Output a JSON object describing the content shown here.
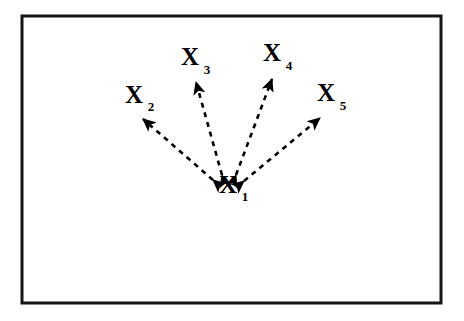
{
  "figure": {
    "background_color": "#ffffff",
    "frame": {
      "stroke_color": "#151515",
      "stroke_width": 3,
      "x": 22,
      "y": 16,
      "width": 419,
      "height": 287
    },
    "line_style": {
      "color": "#000000",
      "dash_pattern": "5 5",
      "stroke_width": 2.6,
      "arrowheads": "both-ends",
      "arrowhead_fill": "#000000"
    }
  },
  "nodes": [
    {
      "id": "x1",
      "symbol": "X",
      "subscript": "1",
      "label": "X1",
      "role": "center",
      "x": 228,
      "y": 193,
      "subscript_x": 245,
      "subscript_y": 201
    },
    {
      "id": "x2",
      "symbol": "X",
      "subscript": "2",
      "label": "X2",
      "role": "outer",
      "x": 134,
      "y": 103,
      "subscript_x": 151,
      "subscript_y": 111
    },
    {
      "id": "x3",
      "symbol": "X",
      "subscript": "3",
      "label": "X3",
      "role": "outer",
      "x": 190,
      "y": 65,
      "subscript_x": 207,
      "subscript_y": 74
    },
    {
      "id": "x4",
      "symbol": "X",
      "subscript": "4",
      "label": "X4",
      "role": "outer",
      "x": 272,
      "y": 61,
      "subscript_x": 289,
      "subscript_y": 70
    },
    {
      "id": "x5",
      "symbol": "X",
      "subscript": "5",
      "label": "X5",
      "role": "outer",
      "x": 326,
      "y": 101,
      "subscript_x": 343,
      "subscript_y": 110
    }
  ],
  "edges": [
    {
      "id": "edge-x1-x2",
      "from": "x1",
      "to": "x2",
      "direction": "bidirectional",
      "x1": 213,
      "y1": 180,
      "x2": 143,
      "y2": 119
    },
    {
      "id": "edge-x1-x3",
      "from": "x1",
      "to": "x3",
      "direction": "bidirectional",
      "x1": 222,
      "y1": 175,
      "x2": 196,
      "y2": 82
    },
    {
      "id": "edge-x1-x4",
      "from": "x1",
      "to": "x4",
      "direction": "bidirectional",
      "x1": 236,
      "y1": 175,
      "x2": 272,
      "y2": 79
    },
    {
      "id": "edge-x1-x5",
      "from": "x1",
      "to": "x5",
      "direction": "bidirectional",
      "x1": 244,
      "y1": 181,
      "x2": 320,
      "y2": 118
    }
  ]
}
